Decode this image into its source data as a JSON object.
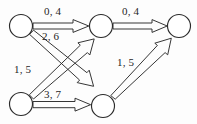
{
  "figure": {
    "type": "directed-graph-diagram",
    "background_color": "#fdfdfd",
    "ink_color": "#2b2b2b"
  },
  "graph": {
    "nodes": [
      {
        "id": "n1",
        "label": "",
        "cx": 21,
        "cy": 26,
        "r": 11.5,
        "position": "top-left"
      },
      {
        "id": "n2",
        "label": "",
        "cx": 101,
        "cy": 26,
        "r": 11.5,
        "position": "top-middle"
      },
      {
        "id": "n3",
        "label": "",
        "cx": 179,
        "cy": 26,
        "r": 11.5,
        "position": "top-right"
      },
      {
        "id": "n4",
        "label": "",
        "cx": 21,
        "cy": 104,
        "r": 11.5,
        "position": "bottom-left"
      },
      {
        "id": "n5",
        "label": "",
        "cx": 103,
        "cy": 106,
        "r": 11.5,
        "position": "bottom-middle"
      }
    ],
    "edges": [
      {
        "id": "e1",
        "from": "n1",
        "to": "n2",
        "label": "0, 4",
        "label_x": 44,
        "label_y": 6
      },
      {
        "id": "e2",
        "from": "n2",
        "to": "n3",
        "label": "0, 4",
        "label_x": 122,
        "label_y": 6
      },
      {
        "id": "e3",
        "from": "n4",
        "to": "n2",
        "label": "2, 6",
        "label_x": 42,
        "label_y": 31
      },
      {
        "id": "e4",
        "from": "n1",
        "to": "n5",
        "label": "1, 5",
        "label_x": 14,
        "label_y": 64
      },
      {
        "id": "e5",
        "from": "n4",
        "to": "n5",
        "label": "3, 7",
        "label_x": 44,
        "label_y": 89
      },
      {
        "id": "e6",
        "from": "n5",
        "to": "n3",
        "label": "1, 5",
        "label_x": 117,
        "label_y": 57
      }
    ]
  }
}
